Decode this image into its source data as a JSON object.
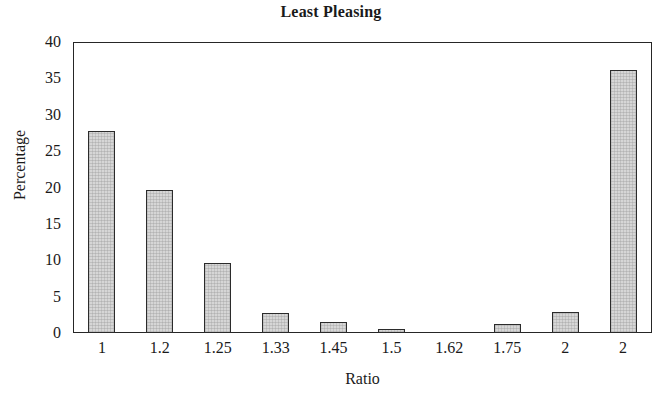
{
  "chart_data": {
    "type": "bar",
    "title": "Least Pleasing",
    "xlabel": "Ratio",
    "ylabel": "Percentage",
    "categories": [
      "1",
      "1.2",
      "1.25",
      "1.33",
      "1.45",
      "1.5",
      "1.62",
      "1.75",
      "2",
      "2"
    ],
    "values": [
      27.8,
      19.7,
      9.6,
      2.7,
      1.5,
      0.5,
      0,
      1.2,
      2.9,
      36.2
    ],
    "ylim": [
      0,
      40
    ],
    "yticks": [
      0,
      5,
      10,
      15,
      20,
      25,
      30,
      35,
      40
    ],
    "ytick_labels": [
      "0",
      "5",
      "10",
      "15",
      "20",
      "25",
      "30",
      "35",
      "40"
    ],
    "grid": false,
    "legend": false,
    "bar_fill_color": "#d6d6d6",
    "bar_edge_color": "#2b2b2b",
    "axis_color": "#262626",
    "background_color": "#ffffff"
  }
}
